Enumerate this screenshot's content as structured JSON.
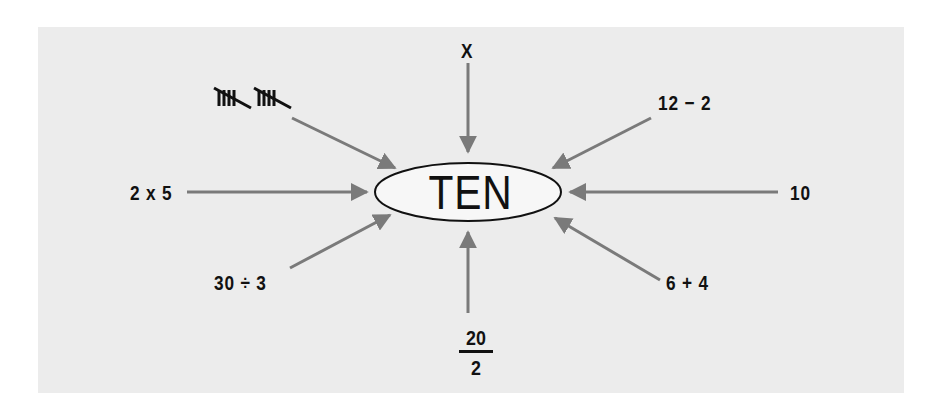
{
  "diagram": {
    "center": {
      "label": "TEN",
      "shape": "ellipse"
    },
    "colors": {
      "background": "#ffffff",
      "panel": "#ececec",
      "arrow": "#7a7a7a",
      "text": "#111111",
      "ellipse_fill": "#f7f7f7",
      "ellipse_stroke": "#111111"
    },
    "representations": [
      {
        "id": "tally",
        "label": "tally marks (two groups of five)",
        "position": "top-left"
      },
      {
        "id": "roman",
        "label": "X",
        "position": "top"
      },
      {
        "id": "subtraction",
        "label": "12 − 2",
        "position": "top-right"
      },
      {
        "id": "multiplication",
        "label": "2 x 5",
        "position": "left"
      },
      {
        "id": "numeral",
        "label": "10",
        "position": "right"
      },
      {
        "id": "division",
        "label": "30 ÷ 3",
        "position": "bottom-left"
      },
      {
        "id": "fraction",
        "numerator": "20",
        "denominator": "2",
        "position": "bottom"
      },
      {
        "id": "addition",
        "label": "6 + 4",
        "position": "bottom-right"
      }
    ]
  }
}
